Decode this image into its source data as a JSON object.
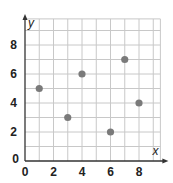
{
  "chart_data": {
    "type": "scatter",
    "title": "",
    "xlabel": "x",
    "ylabel": "y",
    "xlim": [
      0,
      9.5
    ],
    "ylim": [
      0,
      9.8
    ],
    "grid": true,
    "x_ticks": [
      0,
      2,
      4,
      6,
      8
    ],
    "y_ticks": [
      0,
      2,
      4,
      6,
      8
    ],
    "x_tick_labels": [
      "0",
      "2",
      "4",
      "6",
      "8"
    ],
    "y_tick_labels": [
      "0",
      "2",
      "4",
      "6",
      "8"
    ],
    "points": [
      {
        "x": 1,
        "y": 5
      },
      {
        "x": 3,
        "y": 3
      },
      {
        "x": 4,
        "y": 6
      },
      {
        "x": 6,
        "y": 2
      },
      {
        "x": 7,
        "y": 7
      },
      {
        "x": 8,
        "y": 4
      }
    ],
    "colors": {
      "grid": "#c8c8c8",
      "axis": "#333333",
      "point": "#7a7a7a",
      "text": "#222222"
    }
  }
}
